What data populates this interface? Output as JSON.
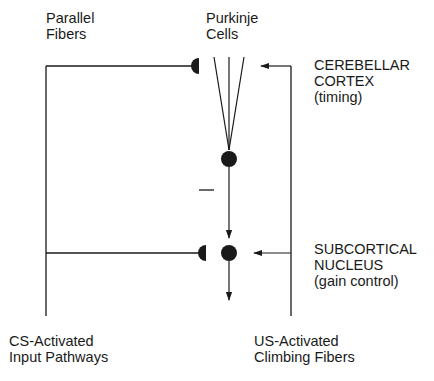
{
  "labels": {
    "parallel_fibers": [
      "Parallel",
      "Fibers"
    ],
    "purkinje_cells": [
      "Purkinje",
      "Cells"
    ],
    "cerebellar_cortex": [
      "CEREBELLAR",
      "CORTEX",
      "(timing)"
    ],
    "subcortical_nucleus": [
      "SUBCORTICAL",
      "NUCLEUS",
      "(gain control)"
    ],
    "cs_input": [
      "CS-Activated",
      "Input Pathways"
    ],
    "us_climbing": [
      "US-Activated",
      "Climbing Fibers"
    ]
  },
  "signs": {
    "inhibitory": "—"
  },
  "colors": {
    "line": "#1a1a1a",
    "background": "#ffffff"
  }
}
